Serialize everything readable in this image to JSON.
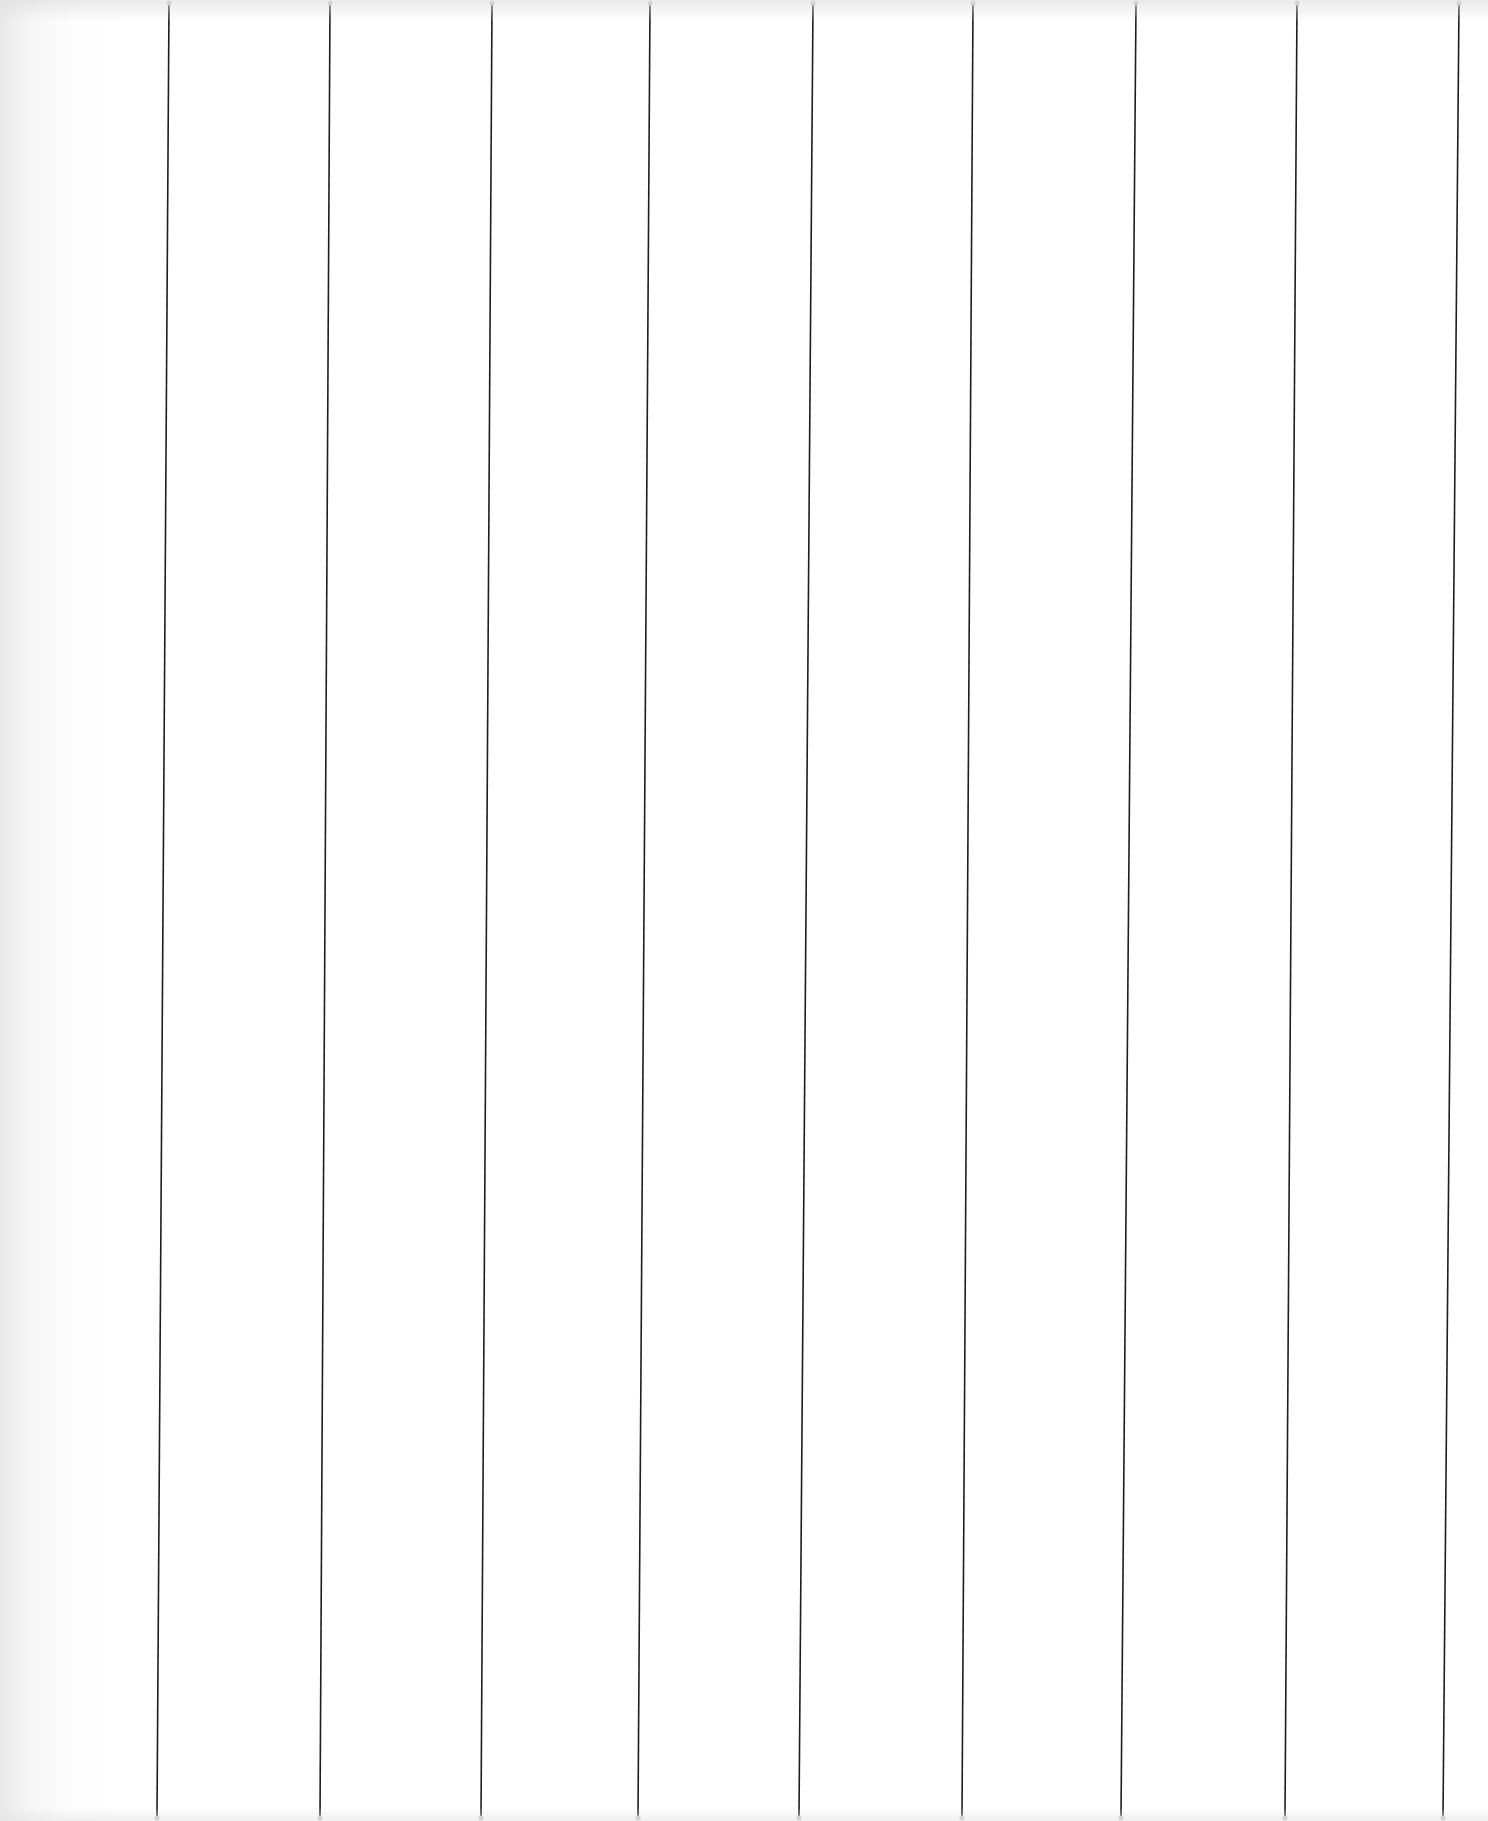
{
  "page": {
    "background": "#ffffff",
    "line_color": "#1e1e1e",
    "line_width": 1.6,
    "height": 1821,
    "width": 1488
  },
  "rules": [
    {
      "x_top": 169,
      "x_bottom": 157
    },
    {
      "x_top": 330,
      "x_bottom": 320
    },
    {
      "x_top": 492,
      "x_bottom": 481
    },
    {
      "x_top": 650,
      "x_bottom": 638
    },
    {
      "x_top": 813,
      "x_bottom": 799
    },
    {
      "x_top": 973,
      "x_bottom": 962
    },
    {
      "x_top": 1136,
      "x_bottom": 1121
    },
    {
      "x_top": 1297,
      "x_bottom": 1285
    },
    {
      "x_top": 1459,
      "x_bottom": 1443
    }
  ]
}
